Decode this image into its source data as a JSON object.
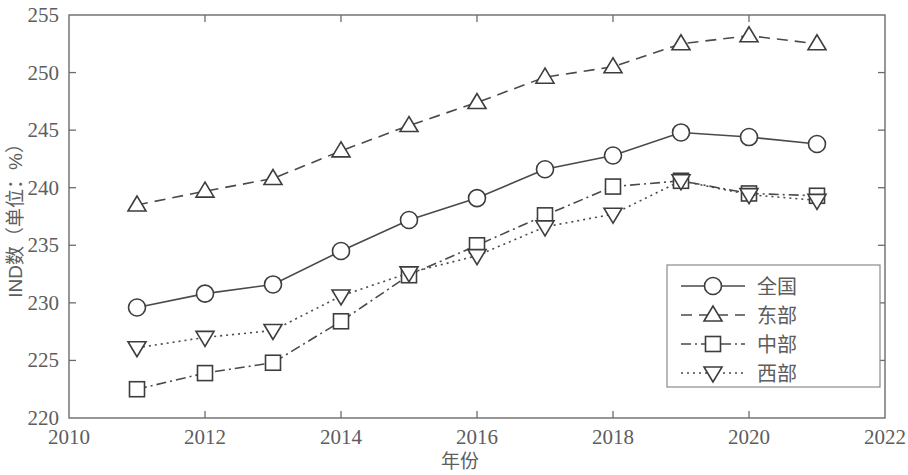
{
  "chart_data": {
    "type": "line",
    "title": "",
    "xlabel": "年份",
    "ylabel": "IND数（单位：%）",
    "xlim": [
      2010,
      2022
    ],
    "ylim": [
      220,
      255
    ],
    "xticks": [
      "2010",
      "2012",
      "2014",
      "2016",
      "2018",
      "2020",
      "2022"
    ],
    "xtick_values": [
      2010,
      2012,
      2014,
      2016,
      2018,
      2020,
      2022
    ],
    "yticks": [
      "220",
      "225",
      "230",
      "235",
      "240",
      "245",
      "250",
      "255"
    ],
    "ytick_values": [
      220,
      225,
      230,
      235,
      240,
      245,
      250,
      255
    ],
    "grid": false,
    "legend_position": "lower right",
    "x": [
      2011,
      2012,
      2013,
      2014,
      2015,
      2016,
      2017,
      2018,
      2019,
      2020,
      2021
    ],
    "series": [
      {
        "name": "全国",
        "marker": "circle",
        "linestyle": "solid",
        "color": "#3d3d3d",
        "values": [
          229.6,
          230.8,
          231.6,
          234.5,
          237.2,
          239.1,
          241.6,
          242.8,
          244.8,
          244.4,
          243.8
        ]
      },
      {
        "name": "东部",
        "marker": "triangle-up",
        "linestyle": "dashed",
        "color": "#3d3d3d",
        "values": [
          238.5,
          239.7,
          240.8,
          243.2,
          245.4,
          247.4,
          249.6,
          250.5,
          252.5,
          253.2,
          252.5
        ]
      },
      {
        "name": "中部",
        "marker": "square",
        "linestyle": "dashdot",
        "color": "#3d3d3d",
        "values": [
          222.5,
          223.9,
          224.8,
          228.4,
          232.4,
          235.0,
          237.6,
          240.1,
          240.6,
          239.5,
          239.3
        ]
      },
      {
        "name": "西部",
        "marker": "triangle-down",
        "linestyle": "dotted",
        "color": "#3d3d3d",
        "values": [
          226.1,
          227.0,
          227.6,
          230.6,
          232.6,
          234.1,
          236.6,
          237.7,
          240.6,
          239.4,
          238.9
        ]
      }
    ]
  },
  "legend": {
    "items": [
      {
        "label": "全国"
      },
      {
        "label": "东部"
      },
      {
        "label": "中部"
      },
      {
        "label": "西部"
      }
    ]
  },
  "colors": {
    "axis": "#6b6b6b",
    "text": "#5d5d5d",
    "line": "#3d3d3d",
    "background": "#ffffff"
  }
}
